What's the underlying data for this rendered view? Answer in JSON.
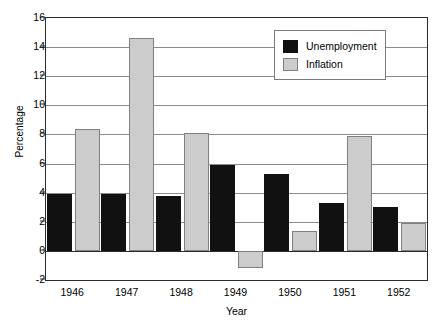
{
  "chart_data": {
    "type": "bar",
    "title": "",
    "xlabel": "Year",
    "ylabel": "Percentage",
    "categories": [
      "1946",
      "1947",
      "1948",
      "1949",
      "1950",
      "1951",
      "1952"
    ],
    "series": [
      {
        "name": "Unemployment",
        "color": "#111111",
        "values": [
          3.9,
          3.9,
          3.8,
          5.9,
          5.3,
          3.3,
          3.0
        ]
      },
      {
        "name": "Inflation",
        "color": "#cccccc",
        "values": [
          8.4,
          14.6,
          8.1,
          -1.2,
          1.4,
          7.9,
          1.9
        ]
      }
    ],
    "ylim": [
      -2,
      16
    ],
    "ytick_labels": [
      "16",
      "14",
      "12",
      "10",
      "8",
      "6",
      "4",
      "2",
      "0",
      "-2"
    ],
    "ytick_values": [
      16,
      14,
      12,
      10,
      8,
      6,
      4,
      2,
      0,
      -2
    ],
    "grid": true,
    "legend_position": "top-right"
  },
  "legend": {
    "entries": [
      {
        "label": "Unemployment"
      },
      {
        "label": "Inflation"
      }
    ]
  },
  "colors": {
    "unemployment": "#111111",
    "inflation": "#cccccc",
    "gridline": "#8c8c8c",
    "axis": "#2b2b2b",
    "background": "#ffffff"
  }
}
